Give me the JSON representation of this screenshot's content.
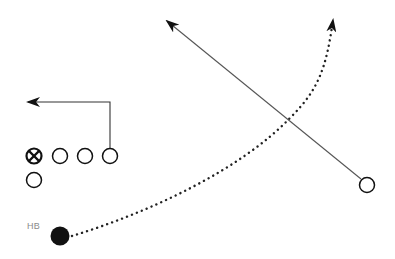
{
  "diagram": {
    "type": "football-play",
    "colors": {
      "ink": "#111111",
      "route": "#444444",
      "label": "#8a8a8a"
    },
    "players": [
      {
        "id": "center",
        "symbol": "x-circle",
        "x": 34,
        "y": 156
      },
      {
        "id": "lineman-1",
        "symbol": "circle",
        "x": 60,
        "y": 156
      },
      {
        "id": "lineman-2",
        "symbol": "circle",
        "x": 85,
        "y": 156
      },
      {
        "id": "end",
        "symbol": "circle",
        "x": 110,
        "y": 156
      },
      {
        "id": "backfield",
        "symbol": "circle",
        "x": 34,
        "y": 180
      },
      {
        "id": "receiver-right",
        "symbol": "circle",
        "x": 367,
        "y": 185
      },
      {
        "id": "hb",
        "symbol": "filled-circle",
        "x": 60,
        "y": 236,
        "label": "HB"
      }
    ],
    "routes": [
      {
        "from": "end",
        "style": "solid",
        "description": "up then left out route"
      },
      {
        "from": "receiver-right",
        "style": "solid",
        "description": "diagonal up-left route"
      },
      {
        "from": "hb",
        "style": "dotted",
        "description": "curving wheel route upfield"
      }
    ]
  },
  "labels": {
    "hb": "HB"
  }
}
